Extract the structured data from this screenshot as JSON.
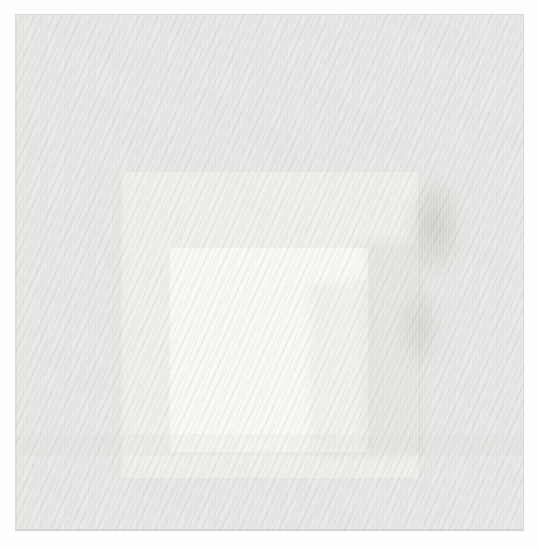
{
  "page": {
    "background": "#fefefe"
  },
  "artwork": {
    "description": "Scanned pale painting of three nested squares (Homage-to-the-Square style), squares centered horizontally and shifted toward the bottom edge, with woven canvas texture and faint gray scan smudges near the right side",
    "squares": [
      {
        "id": "outer",
        "color": "#e6e6e4"
      },
      {
        "id": "middle",
        "color": "#eeeeea"
      },
      {
        "id": "inner",
        "color": "#f8f8f4"
      }
    ],
    "texture": {
      "weave_stripe_color": "#989d96",
      "smudge_color": "#a6aaa3",
      "edge_line_color": "#cdcfca"
    }
  }
}
